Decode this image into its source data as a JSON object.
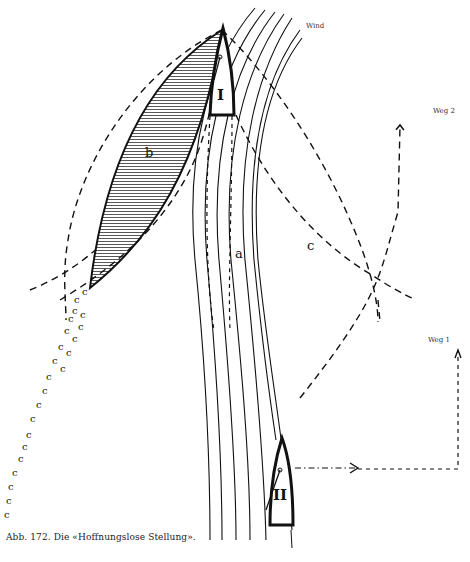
{
  "figure": {
    "caption": "Abb. 172.  Die «Hoffnungslose Stellung».",
    "labels": {
      "wind": "Wind",
      "weg1": "Weg 1",
      "weg2": "Weg 2",
      "boat1": "I",
      "boat2": "II",
      "region_a": "a",
      "region_b": "b",
      "region_c": "c"
    },
    "colors": {
      "ink": "#111111",
      "background": "#ffffff"
    },
    "elements": [
      "wind-shadow-streamlines",
      "boat-I-hull",
      "boat-II-hull",
      "shaded-wind-shadow-b",
      "dashed-arc-c",
      "dashed-arc-outer",
      "path-weg-1",
      "path-weg-2",
      "wake-trail"
    ]
  }
}
